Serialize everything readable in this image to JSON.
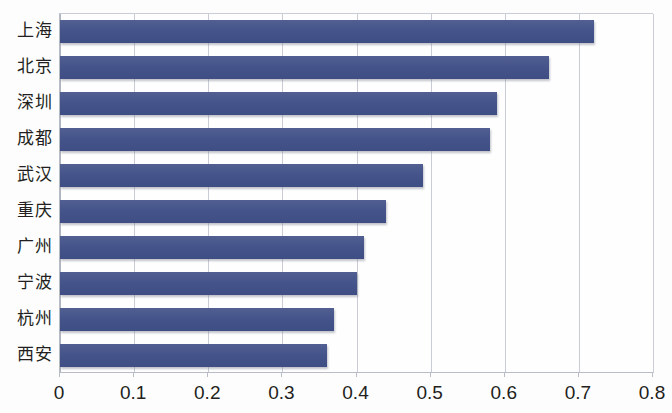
{
  "chart_data": {
    "type": "bar",
    "orientation": "horizontal",
    "title": "",
    "subtitle": "",
    "xlabel": "",
    "ylabel": "",
    "grid": true,
    "legend": false,
    "legend_position": "none",
    "xlim": [
      0,
      0.8
    ],
    "xticks": [
      "0",
      "0.1",
      "0.2",
      "0.3",
      "0.4",
      "0.5",
      "0.6",
      "0.7",
      "0.8"
    ],
    "xtick_values": [
      0,
      0.1,
      0.2,
      0.3,
      0.4,
      0.5,
      0.6,
      0.7,
      0.8
    ],
    "categories": [
      "上海",
      "北京",
      "深圳",
      "成都",
      "武汉",
      "重庆",
      "广州",
      "宁波",
      "杭州",
      "西安"
    ],
    "values": [
      0.72,
      0.66,
      0.59,
      0.58,
      0.49,
      0.44,
      0.41,
      0.4,
      0.37,
      0.36
    ],
    "series": [
      {
        "name": "",
        "values": [
          0.72,
          0.66,
          0.59,
          0.58,
          0.49,
          0.44,
          0.41,
          0.4,
          0.37,
          0.36
        ]
      }
    ],
    "colors": {
      "bar": "#46568c",
      "grid": "#c9ccd4",
      "axis": "#b8bcc6",
      "text": "#231f20",
      "background": "#fdfdfd"
    }
  }
}
